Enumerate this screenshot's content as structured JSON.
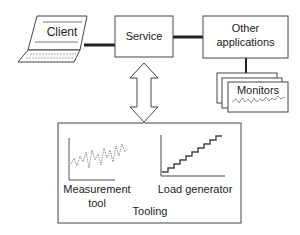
{
  "nodes": {
    "client": "Client",
    "service": "Service",
    "other_apps_line1": "Other",
    "other_apps_line2": "applications",
    "monitors": "Monitors",
    "measurement_tool_line1": "Measurement",
    "measurement_tool_line2": "tool",
    "load_generator": "Load generator",
    "tooling": "Tooling"
  }
}
